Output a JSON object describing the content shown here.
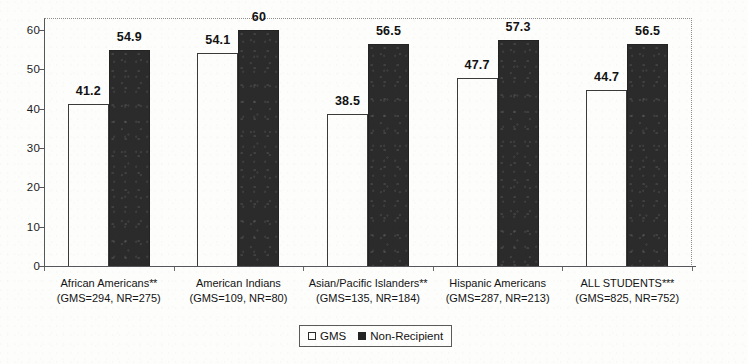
{
  "chart_data": {
    "type": "bar",
    "title": "",
    "subtitle": "",
    "xlabel": "",
    "ylabel": "",
    "ylim": [
      0,
      63
    ],
    "yticks": [
      0,
      10,
      20,
      30,
      40,
      50,
      60
    ],
    "grid": false,
    "legend_position": "bottom-center",
    "categories": [
      "African Americans**",
      "American Indians",
      "Asian/Pacific Islanders**",
      "Hispanic Americans",
      "ALL STUDENTS***"
    ],
    "category_sublabels": [
      "(GMS=294, NR=275)",
      "(GMS=109, NR=80)",
      "(GMS=135, NR=184)",
      "(GMS=287, NR=213)",
      "(GMS=825, NR=752)"
    ],
    "series": [
      {
        "name": "GMS",
        "color": "#ffffff",
        "edge_color": "#3a3a3a",
        "values": [
          41.2,
          54.1,
          38.5,
          47.7,
          44.7
        ],
        "labels": [
          "41.2",
          "54.1",
          "38.5",
          "47.7",
          "44.7"
        ]
      },
      {
        "name": "Non-Recipient",
        "color": "#2b2b2b",
        "edge_color": "#242424",
        "values": [
          54.9,
          60,
          56.5,
          57.3,
          56.5
        ],
        "labels": [
          "54.9",
          "60",
          "56.5",
          "57.3",
          "56.5"
        ]
      }
    ]
  },
  "legend": {
    "items": [
      {
        "label": "GMS",
        "swatch": "hollow-square-icon"
      },
      {
        "label": "Non-Recipient",
        "swatch": "filled-square-icon"
      }
    ]
  },
  "axis": {
    "y_tick_labels": [
      "60",
      "50",
      "40",
      "30",
      "20",
      "10",
      "0"
    ]
  }
}
